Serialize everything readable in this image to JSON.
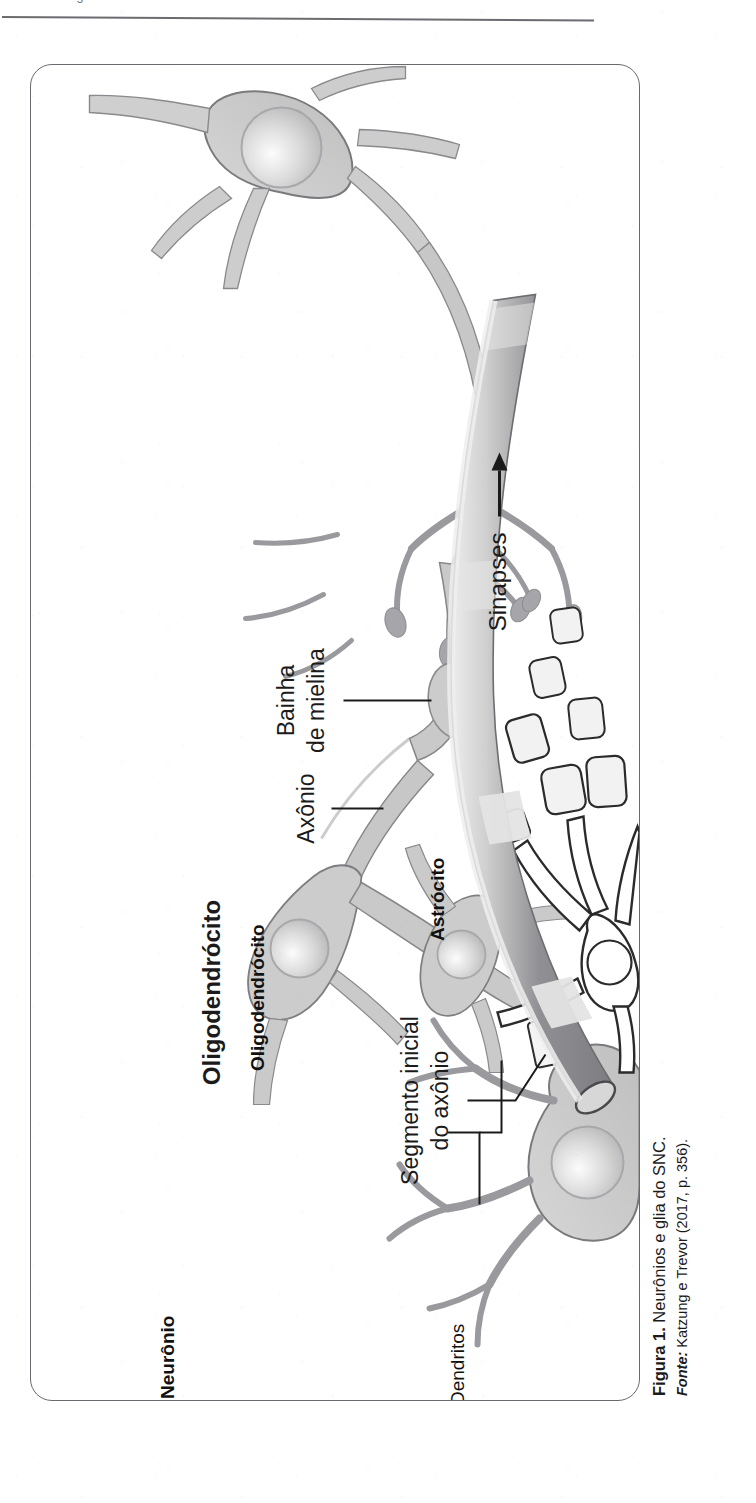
{
  "page": {
    "header_running_text": "a Farmacologia do Sistema Nervoso Central",
    "background_color": "#ffffff",
    "frame_color": "#6a6a6e"
  },
  "caption": {
    "figure_label": "Figura 1.",
    "figure_title": " Neurônios e glia do SNC.",
    "source_label": "Fonte:",
    "source_text": " Katzung e Trevor (2017, p. 356)."
  },
  "figure": {
    "title": "Neurônios e glia do SNC",
    "orientation": "rotated-90-counterclockwise",
    "palette": {
      "neuron_fill": "#c9c9c9",
      "neuron_stroke": "#6f6f73",
      "nucleus_fill": "#d8d8d8",
      "glia_fill": "#ffffff",
      "glia_stroke": "#2b2b2b",
      "vessel_dark": "#8a8a8e",
      "vessel_light": "#e8e8e8",
      "label_color": "#1b1b1b"
    },
    "labels": [
      {
        "id": "sinapses",
        "text": "Sinapses",
        "bold": false,
        "leader": "arrow"
      },
      {
        "id": "bainha-mielina-1",
        "text": "Bainha",
        "bold": false,
        "leader": "line"
      },
      {
        "id": "bainha-mielina-2",
        "text": "de mielina",
        "bold": false,
        "leader": "none"
      },
      {
        "id": "axonio",
        "text": "Axônio",
        "bold": false,
        "leader": "line"
      },
      {
        "id": "oligodendrocito",
        "text": "Oligodendrócito",
        "bold": true,
        "leader": "none"
      },
      {
        "id": "astrocito",
        "text": "Astrócito",
        "bold": true,
        "leader": "none"
      },
      {
        "id": "segmento-1",
        "text": "Segmento inicial",
        "bold": false,
        "leader": "line"
      },
      {
        "id": "segmento-2",
        "text": "do axônio",
        "bold": false,
        "leader": "none"
      },
      {
        "id": "neuronio",
        "text": "Neurônio",
        "bold": true,
        "leader": "none"
      },
      {
        "id": "dendritos",
        "text": "Dendritos",
        "bold": false,
        "leader": "bracket"
      }
    ],
    "structures": [
      "neuron-soma-top",
      "axon-terminals-synapses",
      "myelin-sheath",
      "axon",
      "oligodendrocyte-cell",
      "oligodendrocyte-second-cell",
      "astrocyte-cell",
      "astrocyte-endfeet",
      "blood-vessel-capillary",
      "neuron-soma-bottom",
      "dendrites",
      "initial-segment"
    ]
  }
}
